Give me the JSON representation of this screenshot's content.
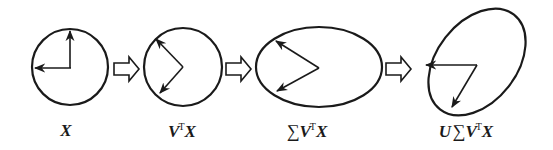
{
  "diagram": {
    "colors": {
      "stroke": "#1a1a1a",
      "background": "#ffffff",
      "arrow_fill": "#ffffff"
    },
    "stages": [
      {
        "id": "x",
        "shape": "circle",
        "label_parts": {
          "pre": "",
          "sigma": "",
          "base": "V",
          "sup": "",
          "tail": "X"
        },
        "label": "X"
      },
      {
        "id": "vtx",
        "shape": "circle",
        "label": "VᵀX"
      },
      {
        "id": "svtx",
        "shape": "ellipse",
        "label": "∑VᵀX"
      },
      {
        "id": "usvtx",
        "shape": "rotated-ellipse",
        "label": "U∑VᵀX"
      }
    ],
    "labels": {
      "stage1": {
        "main": "X"
      },
      "stage2": {
        "v": "V",
        "sup": "T",
        "x": "X"
      },
      "stage3": {
        "sigma": "∑",
        "v": "V",
        "sup": "T",
        "x": "X"
      },
      "stage4": {
        "u": "U",
        "sigma": "∑",
        "v": "V",
        "sup": "T",
        "x": "X"
      }
    },
    "transition_arrows": [
      "hollow-right-arrow",
      "hollow-right-arrow",
      "hollow-right-arrow"
    ]
  }
}
